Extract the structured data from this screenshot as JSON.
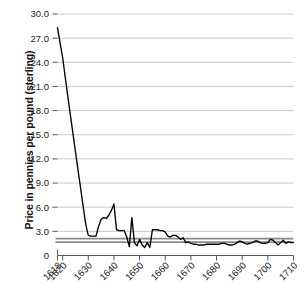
{
  "chart_data": {
    "type": "line",
    "title": "",
    "xlabel": "",
    "ylabel": "Price in pennies per pound (sterling)",
    "xlim": [
      1618,
      1710
    ],
    "ylim": [
      0,
      30
    ],
    "grid": true,
    "legend": "none",
    "ytick_labels": [
      "30.0",
      "27.0",
      "24.0",
      "21.0",
      "18.0",
      "15.0",
      "12.0",
      "9.0",
      "6.0",
      "3.0",
      "0"
    ],
    "ytick_values": [
      30.0,
      27.0,
      24.0,
      21.0,
      18.0,
      15.0,
      12.0,
      9.0,
      6.0,
      3.0,
      0
    ],
    "xtick_labels": [
      "1618",
      "1620",
      "1630",
      "1640",
      "1650",
      "1660",
      "1670",
      "1680",
      "1690",
      "1700",
      "1710"
    ],
    "xtick_values": [
      1618,
      1620,
      1630,
      1640,
      1650,
      1660,
      1670,
      1680,
      1690,
      1700,
      1710
    ],
    "annotations": [
      {
        "name": "reference-band-upper",
        "value": 2.1,
        "color": "#8a8a8a",
        "style": "horizontal-line"
      },
      {
        "name": "reference-band-lower",
        "value": 1.65,
        "color": "#8a8a8a",
        "style": "horizontal-line"
      }
    ],
    "series": [
      {
        "name": "Price in pennies per pound (sterling)",
        "color": "#000000",
        "x": [
          1618,
          1619,
          1620,
          1621,
          1622,
          1623,
          1624,
          1625,
          1626,
          1627,
          1628,
          1629,
          1630,
          1631,
          1632,
          1633,
          1634,
          1635,
          1636,
          1637,
          1638,
          1639,
          1640,
          1641,
          1642,
          1643,
          1644,
          1645,
          1646,
          1647,
          1648,
          1649,
          1650,
          1651,
          1652,
          1653,
          1654,
          1655,
          1656,
          1657,
          1658,
          1659,
          1660,
          1661,
          1662,
          1663,
          1664,
          1665,
          1666,
          1667,
          1668,
          1669,
          1670,
          1671,
          1672,
          1673,
          1674,
          1675,
          1676,
          1677,
          1678,
          1679,
          1680,
          1681,
          1682,
          1683,
          1684,
          1685,
          1686,
          1687,
          1688,
          1689,
          1690,
          1691,
          1692,
          1693,
          1694,
          1695,
          1696,
          1697,
          1698,
          1699,
          1700,
          1701,
          1702,
          1703,
          1704,
          1705,
          1706,
          1707,
          1708,
          1709,
          1710
        ],
        "values": [
          28.3,
          26.4,
          24.6,
          22.2,
          19.8,
          17.5,
          15.2,
          12.9,
          10.6,
          8.4,
          6.1,
          3.9,
          2.5,
          2.4,
          2.4,
          2.4,
          3.6,
          4.5,
          4.7,
          4.6,
          5.0,
          5.6,
          6.4,
          3.2,
          3.1,
          3.1,
          3.1,
          2.3,
          1.1,
          4.7,
          1.6,
          1.2,
          2.0,
          1.3,
          1.0,
          1.6,
          1.0,
          3.2,
          3.2,
          3.2,
          3.1,
          3.1,
          2.9,
          2.4,
          2.3,
          2.5,
          2.5,
          2.3,
          2.0,
          2.2,
          1.6,
          1.7,
          1.5,
          1.4,
          1.4,
          1.3,
          1.3,
          1.3,
          1.4,
          1.4,
          1.4,
          1.4,
          1.4,
          1.4,
          1.5,
          1.5,
          1.4,
          1.3,
          1.3,
          1.4,
          1.6,
          1.8,
          1.7,
          1.5,
          1.4,
          1.5,
          1.6,
          1.8,
          1.8,
          1.6,
          1.5,
          1.5,
          1.6,
          2.0,
          1.9,
          1.6,
          1.3,
          1.6,
          1.9,
          1.5,
          1.7,
          1.6,
          1.6
        ]
      }
    ]
  }
}
